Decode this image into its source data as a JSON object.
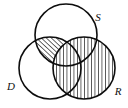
{
  "figure": {
    "type": "venn-diagram",
    "title": "",
    "background_color": "#ffffff",
    "stroke_color": "#0d0d0d",
    "hatch_color": "#101010",
    "width": 128,
    "height": 108
  },
  "sets": [
    {
      "id": "S",
      "label": "S",
      "label_x": 98,
      "label_y": 21,
      "center_x": 66,
      "center_y": 35,
      "radius": 31,
      "fill": "none",
      "position": "top"
    },
    {
      "id": "D",
      "label": "D",
      "label_x": 8,
      "label_y": 90,
      "center_x": 50,
      "center_y": 68,
      "radius": 31,
      "fill": "none",
      "position": "lower-left"
    },
    {
      "id": "R",
      "label": "R",
      "label_x": 115,
      "label_y": 95,
      "center_x": 84,
      "center_y": 68,
      "radius": 31,
      "fill": "vertical-hatch",
      "position": "lower-right"
    }
  ],
  "shaded_regions": [
    {
      "id": "d-and-s-not-r",
      "description": "D intersect S minus R",
      "hatch": "diagonal-hatch"
    },
    {
      "id": "r-all",
      "description": "R entire circle",
      "hatch": "vertical-hatch"
    }
  ]
}
